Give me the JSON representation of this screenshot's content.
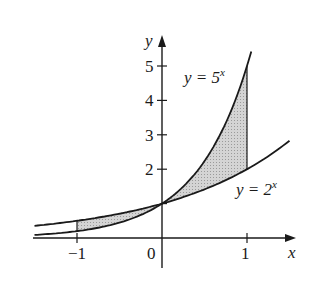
{
  "chart_data": {
    "type": "line",
    "title": "",
    "xlabel": "x",
    "ylabel": "y",
    "x_ticks": [
      -1,
      0,
      1
    ],
    "x_tick_labels": [
      "−1",
      "0",
      "1"
    ],
    "y_ticks": [
      2,
      3,
      4,
      5
    ],
    "y_tick_labels": [
      "2",
      "3",
      "4",
      "5"
    ],
    "xlim": [
      -1.5,
      1.55
    ],
    "ylim": [
      -0.3,
      5.5
    ],
    "grid": false,
    "series": [
      {
        "name": "y = 5^x",
        "label": "y = 5",
        "exponent": "x",
        "base": 5,
        "x": [
          -1.5,
          -1,
          -0.5,
          0,
          0.5,
          1,
          1.05
        ],
        "y": [
          0.09,
          0.2,
          0.45,
          1,
          2.24,
          5,
          5.42
        ]
      },
      {
        "name": "y = 2^x",
        "label": "y = 2",
        "exponent": "x",
        "base": 2,
        "x": [
          -1.5,
          -1,
          -0.5,
          0,
          0.5,
          1,
          1.5
        ],
        "y": [
          0.35,
          0.5,
          0.71,
          1,
          1.41,
          2,
          2.83
        ]
      }
    ],
    "shaded_regions": [
      {
        "between": [
          "y = 2^x",
          "y = 5^x"
        ],
        "x_from": -1,
        "x_to": 0
      },
      {
        "between": [
          "y = 2^x",
          "y = 5^x"
        ],
        "x_from": 0,
        "x_to": 1
      }
    ],
    "vertical_segments_at_x": [
      -1,
      1
    ]
  },
  "labels": {
    "x_axis": "x",
    "y_axis": "y",
    "tick_neg1": "−1",
    "tick_0": "0",
    "tick_1": "1",
    "ytick_2": "2",
    "ytick_3": "3",
    "ytick_4": "4",
    "ytick_5": "5",
    "curve5_prefix": "y = 5",
    "curve5_exp": "x",
    "curve2_prefix": "y = 2",
    "curve2_exp": "x"
  }
}
